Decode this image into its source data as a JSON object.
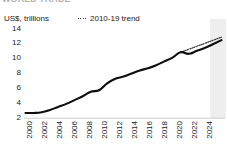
{
  "title_partial": "WORLD TRADE",
  "axis": {
    "unit_label": "US$, trillions",
    "y_ticks": [
      "14",
      "12",
      "10",
      "8",
      "6",
      "4",
      "2"
    ],
    "x_ticks": [
      "2000",
      "2002",
      "2004",
      "2006",
      "2008",
      "2010",
      "2012",
      "2014",
      "2016",
      "2018",
      "2020",
      "2022",
      "2024"
    ]
  },
  "legend": {
    "trend_label": "2010-19 trend",
    "trend_marker": "dotted-line-icon"
  },
  "colors": {
    "series": "#0d0d0d",
    "trend": "#3a3a3a",
    "shade": "#eeeeee",
    "text": "#1a1a1a"
  },
  "chart_data": {
    "type": "line",
    "title": "WORLD TRADE",
    "xlabel": "",
    "ylabel": "US$, trillions",
    "xlim": [
      2000,
      2024
    ],
    "ylim": [
      2,
      14
    ],
    "y_ticks": [
      2,
      4,
      6,
      8,
      10,
      12,
      14
    ],
    "x_ticks": [
      2000,
      2002,
      2004,
      2006,
      2008,
      2010,
      2012,
      2014,
      2016,
      2018,
      2020,
      2022,
      2024
    ],
    "grid": false,
    "legend_position": "top-center",
    "shaded_region": {
      "label": "projection",
      "x_start": 2022.6,
      "x_end": 2024.6,
      "color": "#eeeeee"
    },
    "series": [
      {
        "name": "World trade",
        "style": "solid",
        "color": "#0d0d0d",
        "x": [
          2000,
          2001,
          2002,
          2003,
          2004,
          2005,
          2006,
          2007,
          2008,
          2009,
          2010,
          2011,
          2012,
          2013,
          2014,
          2015,
          2016,
          2017,
          2018,
          2019,
          2020,
          2021,
          2022,
          2023,
          2024
        ],
        "values": [
          2.4,
          2.4,
          2.5,
          2.8,
          3.2,
          3.6,
          4.1,
          4.6,
          5.2,
          5.4,
          6.3,
          6.9,
          7.2,
          7.6,
          8.0,
          8.3,
          8.7,
          9.2,
          9.7,
          10.4,
          10.2,
          10.6,
          11.0,
          11.5,
          12.0
        ]
      },
      {
        "name": "2010-19 trend",
        "style": "dotted",
        "color": "#3a3a3a",
        "x": [
          2019,
          2020,
          2021,
          2022,
          2023,
          2024
        ],
        "values": [
          10.4,
          10.8,
          11.2,
          11.6,
          12.0,
          12.4
        ]
      }
    ]
  }
}
